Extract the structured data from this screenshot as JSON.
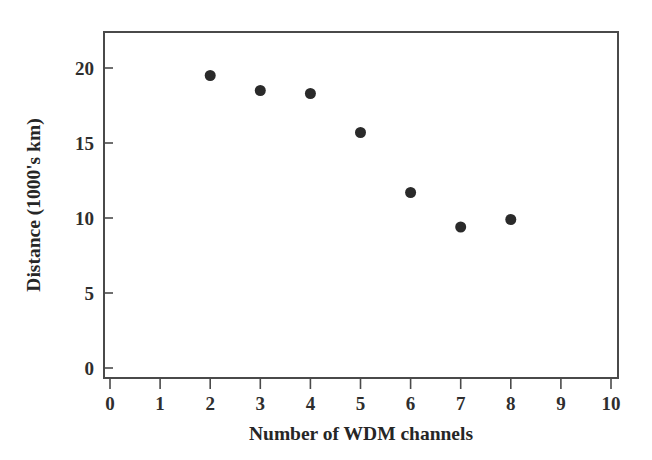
{
  "chart_data": {
    "type": "scatter",
    "title": "",
    "xlabel": "Number of WDM channels",
    "ylabel": "Distance (1000's km)",
    "xlim": [
      0,
      10
    ],
    "ylim": [
      0,
      22.4
    ],
    "xticks": [
      "0",
      "1",
      "2",
      "3",
      "4",
      "5",
      "6",
      "7",
      "8",
      "9",
      "10"
    ],
    "yticks": [
      "0",
      "5",
      "10",
      "15",
      "20"
    ],
    "xtick_values": [
      0,
      1,
      2,
      3,
      4,
      5,
      6,
      7,
      8,
      9,
      10
    ],
    "ytick_values": [
      0,
      5,
      10,
      15,
      20
    ],
    "grid": false,
    "legend": false,
    "marker": "filled-circle",
    "marker_color": "#2a2a2a",
    "marker_size": 11,
    "x": [
      2,
      3,
      4,
      5,
      6,
      7,
      8
    ],
    "y": [
      19.5,
      18.5,
      18.3,
      15.7,
      11.7,
      9.4,
      9.9
    ],
    "points": [
      {
        "x": 2,
        "y": 19.5
      },
      {
        "x": 3,
        "y": 18.5
      },
      {
        "x": 4,
        "y": 18.3
      },
      {
        "x": 5,
        "y": 15.7
      },
      {
        "x": 6,
        "y": 11.7
      },
      {
        "x": 7,
        "y": 9.4
      },
      {
        "x": 8,
        "y": 9.9
      }
    ]
  },
  "axes": {
    "x_title": "Number of WDM channels",
    "y_title": "Distance (1000's km)"
  }
}
